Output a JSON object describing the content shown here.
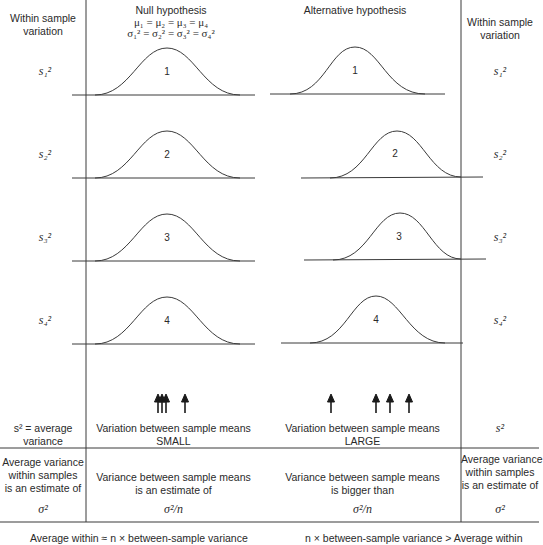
{
  "headers": {
    "left_col": [
      "Within sample",
      "variation"
    ],
    "null_title": "Null hypothesis",
    "null_mu": "μ₁ = μ₂ = μ₃ = μ₄",
    "null_sigma": "σ₁² = σ₂² = σ₃² = σ₄²",
    "alt_title": "Alternative hypothesis",
    "right_col": [
      "Within sample",
      "variation"
    ]
  },
  "rows": [
    {
      "label": "s₁²",
      "curve": "1"
    },
    {
      "label": "s₂²",
      "curve": "2"
    },
    {
      "label": "s₃²",
      "curve": "3"
    },
    {
      "label": "s₄²",
      "curve": "4"
    }
  ],
  "summary": {
    "left_label": [
      "s² = average",
      "variance"
    ],
    "null_text": [
      "Variation between sample means",
      "SMALL"
    ],
    "alt_text": [
      "Variation between sample means",
      "LARGE"
    ],
    "right_label": "s²"
  },
  "estimate": {
    "left": [
      "Average variance",
      "within samples",
      "is an estimate of"
    ],
    "left_value": "σ²",
    "null": [
      "Variance between sample means",
      "is an estimate of"
    ],
    "null_value": "σ²/n",
    "alt": [
      "Variance between sample means",
      "is bigger than"
    ],
    "alt_value": "σ²/n",
    "right": [
      "Average variance",
      "within samples",
      "is an estimate of"
    ],
    "right_value": "σ²"
  },
  "conclusion": {
    "null": "Average within  ≈ n × between-sample variance",
    "alt": "n × between-sample variance >  Average within"
  },
  "arrows": {
    "null_x": [
      158,
      162,
      166,
      185
    ],
    "alt_x": [
      331,
      376,
      390,
      409
    ]
  },
  "colors": {
    "line": "#3a3a3a",
    "text": "#2a2a2a"
  }
}
